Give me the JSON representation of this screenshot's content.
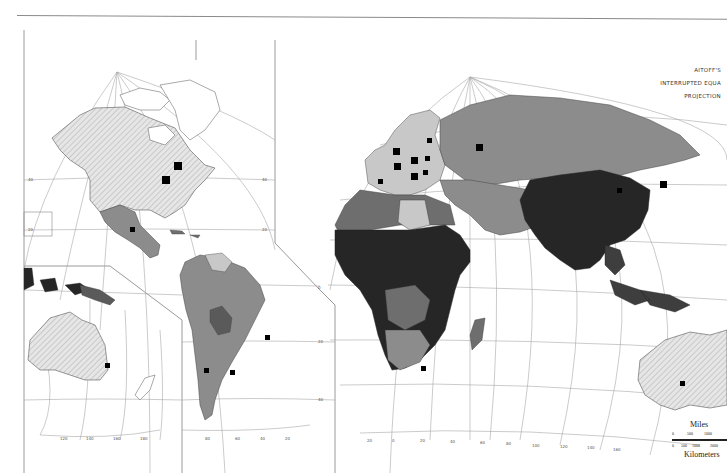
{
  "map": {
    "projection_title": [
      "AITOFF'S",
      "INTERRUPTED EQUA",
      "PROJECTION"
    ],
    "style": "greyscale choropleth",
    "colors": {
      "background": "#ffffff",
      "ocean": "#ffffff",
      "graticule": "#9a9a9a",
      "frame": "#8a8a8a",
      "hatched_land": "#d9d9d9",
      "light": "#c8c8c8",
      "medium": "#8c8c8c",
      "medium_dark": "#6e6e6e",
      "dark": "#3e3e3e",
      "darkest": "#262626",
      "marker": "#000000"
    },
    "scale": {
      "miles_label": "Miles",
      "km_label": "Kilometers",
      "miles_ticks": [
        "0",
        "500",
        "1000"
      ],
      "km_ticks": [
        "0",
        "500",
        "1000",
        "2000"
      ]
    },
    "graticule_labels": {
      "north_america_pole": [
        "160",
        "140",
        "120",
        "100",
        "80",
        "60",
        "40",
        "20"
      ],
      "eurasia_pole": [
        "20",
        "0",
        "20",
        "40",
        "60",
        "80",
        "100",
        "120",
        "140",
        "160",
        "180"
      ],
      "left_lat": [
        "60",
        "40",
        "20",
        "0",
        "20",
        "40"
      ],
      "right_lat": [
        "60",
        "40",
        "20",
        "0",
        "20",
        "40"
      ],
      "bottom_lon_west": [
        "120",
        "140",
        "160",
        "180",
        "80",
        "60",
        "40",
        "20"
      ],
      "bottom_lon_east": [
        "20",
        "0",
        "20",
        "40",
        "60",
        "80",
        "100",
        "120",
        "140",
        "160"
      ],
      "inset_labels": [
        "50",
        "20"
      ]
    },
    "regions": [
      {
        "name": "North America (US/Canada)",
        "shade": "hatched_land"
      },
      {
        "name": "Mexico",
        "shade": "medium"
      },
      {
        "name": "South America",
        "shade": "medium"
      },
      {
        "name": "Europe",
        "shade": "light"
      },
      {
        "name": "Russia",
        "shade": "medium"
      },
      {
        "name": "North Africa",
        "shade": "medium"
      },
      {
        "name": "Libya",
        "shade": "light"
      },
      {
        "name": "Sub-Saharan Africa",
        "shade": "darkest"
      },
      {
        "name": "Middle East",
        "shade": "medium"
      },
      {
        "name": "China / South Asia",
        "shade": "darkest"
      },
      {
        "name": "Southeast Asia",
        "shade": "dark"
      },
      {
        "name": "Australia",
        "shade": "hatched_land"
      }
    ],
    "markers": [
      {
        "region": "Canada",
        "size": "large"
      },
      {
        "region": "USA",
        "size": "large"
      },
      {
        "region": "Mexico",
        "size": "medium"
      },
      {
        "region": "Brazil",
        "size": "medium"
      },
      {
        "region": "Chile",
        "size": "medium"
      },
      {
        "region": "Argentina",
        "size": "medium"
      },
      {
        "region": "Australia (left)",
        "size": "medium"
      },
      {
        "region": "Australia (right)",
        "size": "medium"
      },
      {
        "region": "UK",
        "size": "large"
      },
      {
        "region": "France",
        "size": "large"
      },
      {
        "region": "Germany",
        "size": "large"
      },
      {
        "region": "Italy",
        "size": "large"
      },
      {
        "region": "Spain",
        "size": "medium"
      },
      {
        "region": "Sweden",
        "size": "medium"
      },
      {
        "region": "Poland",
        "size": "medium"
      },
      {
        "region": "Russia",
        "size": "large"
      },
      {
        "region": "China",
        "size": "medium"
      },
      {
        "region": "Japan",
        "size": "large"
      },
      {
        "region": "South Africa",
        "size": "medium"
      }
    ]
  }
}
